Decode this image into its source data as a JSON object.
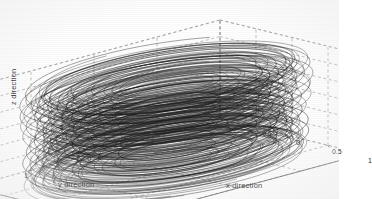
{
  "figure": {
    "kind": "matlab-3d-line-plot",
    "title": "",
    "background_color": "#ffffff",
    "curve_color": "#1a1a1a",
    "grid_color": "#8c8c8c",
    "axis_color": "#4a4a4a",
    "text_color": "#222222"
  },
  "axes": {
    "x": {
      "label": "x direction",
      "ticks": [
        "-1",
        "-0.5",
        "0",
        "0.5",
        "1"
      ],
      "tick_values": [
        -1,
        -0.5,
        0,
        0.5,
        1
      ],
      "range": [
        -1,
        1
      ]
    },
    "y": {
      "label": "y direction",
      "ticks": [
        "2",
        "1",
        "0",
        "-1",
        "-2"
      ],
      "tick_values": [
        2,
        1,
        0,
        -1,
        -2
      ],
      "range": [
        -2,
        2
      ]
    },
    "z": {
      "label": "z direction",
      "ticks": [
        "1.5",
        "1",
        "0.5",
        "0",
        "-0.5",
        "-1",
        "-1.5"
      ],
      "tick_values": [
        1.5,
        1,
        0.5,
        0,
        -0.5,
        -1,
        -1.5
      ],
      "range": [
        -1.5,
        1.5
      ]
    }
  },
  "chart_data": {
    "type": "line",
    "title": "",
    "xlabel": "x direction",
    "ylabel": "y direction",
    "zlabel": "z direction",
    "xlim": [
      -1,
      1
    ],
    "ylim": [
      -2,
      2
    ],
    "zlim": [
      -1.5,
      1.5
    ],
    "grid": true,
    "legend": null,
    "projection": "3d",
    "series": [
      {
        "name": "trajectory-1",
        "turns": 9,
        "radius_x": 0.92,
        "radius_y": 1.78,
        "z_start": -1.45,
        "z_end": 1.45,
        "phase": 0.0
      },
      {
        "name": "trajectory-2",
        "turns": 9,
        "radius_x": 0.88,
        "radius_y": 1.7,
        "z_start": -1.42,
        "z_end": 1.42,
        "phase": 0.5
      },
      {
        "name": "trajectory-3",
        "turns": 9,
        "radius_x": 0.8,
        "radius_y": 1.58,
        "z_start": -1.4,
        "z_end": 1.4,
        "phase": 1.0
      },
      {
        "name": "trajectory-4",
        "turns": 9,
        "radius_x": 0.7,
        "radius_y": 1.42,
        "z_start": -1.38,
        "z_end": 1.38,
        "phase": 1.6
      },
      {
        "name": "trajectory-5",
        "turns": 9,
        "radius_x": 0.58,
        "radius_y": 1.2,
        "z_start": -1.35,
        "z_end": 1.35,
        "phase": 2.2
      },
      {
        "name": "trajectory-6",
        "turns": 9,
        "radius_x": 0.45,
        "radius_y": 0.95,
        "z_start": -1.3,
        "z_end": 1.3,
        "phase": 2.8
      },
      {
        "name": "trajectory-7",
        "turns": 9,
        "radius_x": 0.33,
        "radius_y": 0.7,
        "z_start": -1.25,
        "z_end": 1.25,
        "phase": 3.4
      },
      {
        "name": "trajectory-8",
        "turns": 9,
        "radius_x": 0.95,
        "radius_y": 1.82,
        "z_start": -1.46,
        "z_end": 1.46,
        "phase": 4.0
      },
      {
        "name": "trajectory-9",
        "turns": 9,
        "radius_x": 0.84,
        "radius_y": 1.64,
        "z_start": -1.43,
        "z_end": 1.43,
        "phase": 4.7
      },
      {
        "name": "trajectory-10",
        "turns": 9,
        "radius_x": 0.64,
        "radius_y": 1.32,
        "z_start": -1.36,
        "z_end": 1.36,
        "phase": 5.3
      }
    ]
  }
}
